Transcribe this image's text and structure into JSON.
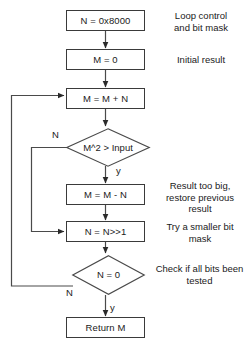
{
  "diagram": {
    "type": "flowchart",
    "background_color": "#ffffff",
    "stroke_color": "#3a3a3a",
    "text_color": "#1a1a1a"
  },
  "nodes": [
    {
      "id": "init_mask",
      "shape": "process",
      "label": "N = 0x8000"
    },
    {
      "id": "init_result",
      "shape": "process",
      "label": "M = 0"
    },
    {
      "id": "add",
      "shape": "process",
      "label": "M = M + N"
    },
    {
      "id": "test_square",
      "shape": "decision",
      "label": "M^2 > Input"
    },
    {
      "id": "subtract",
      "shape": "process",
      "label": "M = M - N"
    },
    {
      "id": "shift",
      "shape": "process",
      "label": "N = N>>1"
    },
    {
      "id": "test_zero",
      "shape": "decision",
      "label": "N = 0"
    },
    {
      "id": "return",
      "shape": "process",
      "label": "Return M"
    }
  ],
  "branch_labels": {
    "square_no": "N",
    "square_yes": "y",
    "zero_no": "N",
    "zero_yes": "y"
  },
  "annotations": [
    {
      "id": "note_mask",
      "lines": "Loop control\nand bit mask"
    },
    {
      "id": "note_result",
      "lines": "Initial result"
    },
    {
      "id": "note_restore",
      "lines": "Result too big,\nrestore previous\nresult"
    },
    {
      "id": "note_shift",
      "lines": "Try a smaller bit\nmask"
    },
    {
      "id": "note_check",
      "lines": "Check if all bits been\ntested"
    }
  ]
}
